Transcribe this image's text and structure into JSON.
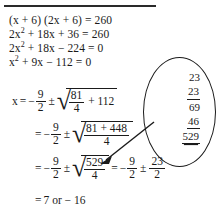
{
  "document": {
    "type": "handwritten-math-worksheet",
    "title_rule": "horizontal-divider",
    "equations": [
      {
        "id": "eq1",
        "lhs_a": "(x + 6)",
        "lhs_b": "(2x + 6)",
        "rel": "=",
        "rhs": "260",
        "text": "(x + 6) (2x + 6) = 260"
      },
      {
        "id": "eq2",
        "coef": "2x",
        "exp": "2",
        "rest": "+ 18x + 36 = 260",
        "text": "2x2 + 18x + 36 = 260"
      },
      {
        "id": "eq3",
        "coef": "2x",
        "exp": "2",
        "rest": "+ 18x − 224 = 0",
        "text": "2x2 + 18x − 224 = 0"
      },
      {
        "id": "eq4",
        "coef": "x",
        "exp": "2",
        "rest": "+ 9x − 112 = 0",
        "text": "x2 + 9x − 112 = 0"
      }
    ],
    "solution": {
      "line1": {
        "lead": "x",
        "equals": "=",
        "sign": "−",
        "frac_num": "9",
        "frac_den": "2",
        "pm": "±",
        "radicand_num": "81",
        "radicand_den": "4",
        "tail": "+ 112"
      },
      "line2": {
        "equals": "=",
        "sign": "−",
        "frac_num": "9",
        "frac_den": "2",
        "pm": "±",
        "radicand_num": "81 + 448",
        "radicand_den": "4"
      },
      "line3": {
        "equals": "=",
        "sign": "−",
        "frac_num": "9",
        "frac_den": "2",
        "pm": "±",
        "radicand_num": "529",
        "radicand_den": "4",
        "equals2": "=",
        "sign2": "−",
        "frac2_num": "9",
        "frac2_den": "2",
        "pm2": "±",
        "frac3_num": "23",
        "frac3_den": "2"
      },
      "line4": {
        "equals": "=",
        "text": "7 or − 16",
        "roots": [
          7,
          -16
        ]
      }
    },
    "side_work": {
      "label": "long-multiplication-23-times-23",
      "rows": [
        {
          "value": "23",
          "style": "plain"
        },
        {
          "value": "23",
          "style": "underline"
        },
        {
          "value": "69",
          "style": "plain"
        },
        {
          "value": "46",
          "style": "underline"
        },
        {
          "value": "529",
          "style": "double-underline"
        }
      ],
      "result": "529"
    },
    "annotation": {
      "shape": "ellipse",
      "leader": "arrow-pointing-to-529",
      "points_to": "529"
    },
    "colors": {
      "ink": "#1a1a1a",
      "paper": "#ffffff"
    }
  }
}
